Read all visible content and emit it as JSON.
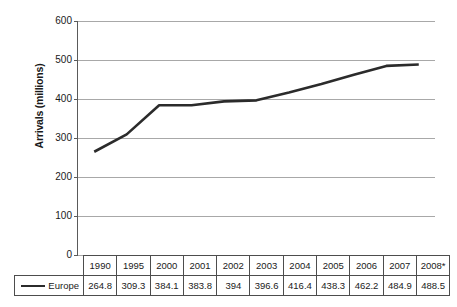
{
  "chart_data": {
    "type": "line",
    "title": "",
    "xlabel": "",
    "ylabel": "Arrivals (millions)",
    "ylim": [
      0,
      600
    ],
    "ytick_step": 100,
    "yticks": [
      "600",
      "500",
      "400",
      "300",
      "200",
      "100",
      "0"
    ],
    "grid": true,
    "legend_position": "bottom-left-table",
    "categories": [
      "1990",
      "1995",
      "2000",
      "2001",
      "2002",
      "2003",
      "2004",
      "2005",
      "2006",
      "2007",
      "2008*"
    ],
    "series": [
      {
        "name": "Europe",
        "values": [
          264.8,
          309.3,
          384.1,
          383.8,
          394,
          396.6,
          416.4,
          438.3,
          462.2,
          484.9,
          488.5
        ],
        "value_labels": [
          "264.8",
          "309.3",
          "384.1",
          "383.8",
          "394",
          "396.6",
          "416.4",
          "438.3",
          "462.2",
          "484.9",
          "488.5"
        ],
        "color": "#2b2b2b"
      }
    ]
  },
  "colors": {
    "line": "#2b2b2b",
    "gridline": "#a8a8a8",
    "axis": "#5a5a5a",
    "table_border": "#4d4d4d",
    "background": "#ffffff"
  }
}
